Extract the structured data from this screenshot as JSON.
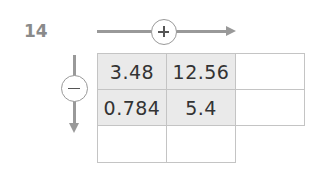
{
  "question_number": "14",
  "operators": {
    "horizontal": {
      "symbol": "plus",
      "direction": "right"
    },
    "vertical": {
      "symbol": "minus",
      "direction": "down"
    }
  },
  "grid": {
    "rows": [
      [
        "3.48",
        "12.56",
        ""
      ],
      [
        "0.784",
        "5.4",
        ""
      ],
      [
        "",
        ""
      ]
    ]
  }
}
